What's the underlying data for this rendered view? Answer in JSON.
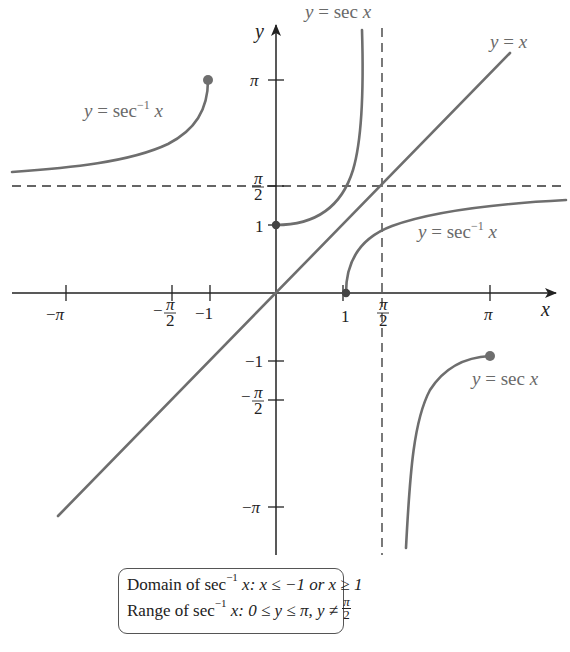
{
  "figure": {
    "axes": {
      "x_label": "x",
      "y_label": "y",
      "x_ticks": [
        {
          "label": "−π",
          "value": -3.14159
        },
        {
          "label": "−π/2",
          "value": -1.5708,
          "frac": {
            "sign": "−",
            "num": "π",
            "den": "2"
          }
        },
        {
          "label": "−1",
          "value": -1
        },
        {
          "label": "1",
          "value": 1
        },
        {
          "label": "π/2",
          "value": 1.5708,
          "frac": {
            "sign": "",
            "num": "π",
            "den": "2"
          }
        },
        {
          "label": "π",
          "value": 3.14159
        }
      ],
      "y_ticks": [
        {
          "label": "π",
          "value": 3.14159
        },
        {
          "label": "π/2",
          "value": 1.5708,
          "frac": {
            "sign": "",
            "num": "π",
            "den": "2"
          }
        },
        {
          "label": "1",
          "value": 1
        },
        {
          "label": "−1",
          "value": -1
        },
        {
          "label": "−π/2",
          "value": -1.5708,
          "frac": {
            "sign": "−",
            "num": "π",
            "den": "2"
          }
        },
        {
          "label": "−π",
          "value": -3.14159
        }
      ]
    },
    "curves": [
      {
        "name": "y = sec x",
        "part": "0 ≤ x < π/2",
        "label": "y = sec x"
      },
      {
        "name": "y = sec x",
        "part": "π/2 < x ≤ π",
        "label": "y = sec x"
      },
      {
        "name": "y = sec⁻¹ x",
        "part": "x ≥ 1",
        "label": "y = sec⁻¹ x"
      },
      {
        "name": "y = sec⁻¹ x",
        "part": "x ≤ −1",
        "label": "y = sec⁻¹ x"
      },
      {
        "name": "y = x",
        "label": "y = x"
      }
    ],
    "asymptotes": [
      {
        "type": "vertical",
        "at": "x = π/2"
      },
      {
        "type": "horizontal",
        "at": "y = π/2"
      }
    ],
    "points": [
      {
        "x": 0,
        "y": 1,
        "style": "closed"
      },
      {
        "x": 1,
        "y": 0,
        "style": "closed"
      },
      {
        "x": 3.14159,
        "y": -1,
        "style": "closed"
      },
      {
        "x": -1,
        "y": 3.14159,
        "style": "closed"
      }
    ],
    "labels": {
      "sec_top": {
        "pre": "y = sec ",
        "var": "x"
      },
      "sec_bottom": {
        "pre": "y = sec ",
        "var": "x"
      },
      "arcsec_left": {
        "pre": "y = sec",
        "sup": "−1",
        "var": "x"
      },
      "arcsec_right": {
        "pre": "y = sec",
        "sup": "−1",
        "var": "x"
      },
      "identity": {
        "text": "y = x"
      }
    }
  },
  "infobox": {
    "line1": {
      "pre": "Domain of sec",
      "sup": "−1",
      "mid": " x: x ≤ −1 or x ≥ 1"
    },
    "line2": {
      "pre": "Range of sec",
      "sup": "−1",
      "mid": " x: 0 ≤ y ≤ π, y ≠ ",
      "frac_num": "π",
      "frac_den": "2"
    }
  },
  "colors": {
    "curve": "#6e6e6e",
    "axis": "#222222",
    "asymptote": "#333333",
    "label": "#6a6a6a"
  }
}
